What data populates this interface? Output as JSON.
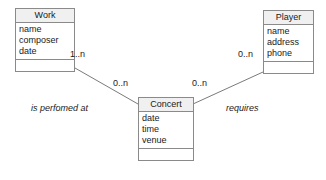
{
  "diagram": {
    "type": "entity-relationship",
    "entities": [
      {
        "id": "work",
        "name": "Work",
        "attributes": [
          "name",
          "composer",
          "date"
        ],
        "operations": []
      },
      {
        "id": "player",
        "name": "Player",
        "attributes": [
          "name",
          "address",
          "phone"
        ],
        "operations": []
      },
      {
        "id": "concert",
        "name": "Concert",
        "attributes": [
          "date",
          "time",
          "venue"
        ],
        "operations": []
      }
    ],
    "relationships": [
      {
        "id": "work-concert",
        "label": "is perfomed at",
        "from": "work",
        "to": "concert",
        "from_cardinality": "1..n",
        "to_cardinality": "0..n"
      },
      {
        "id": "concert-player",
        "label": "requires",
        "from": "concert",
        "to": "player",
        "from_cardinality": "0..n",
        "to_cardinality": "0..n"
      }
    ]
  },
  "colors": {
    "background": "#ffffff",
    "border": "#8a8a8a",
    "header_fill": "#f0f0f0",
    "text": "#1a1a1a",
    "line": "#7a7a7a"
  }
}
